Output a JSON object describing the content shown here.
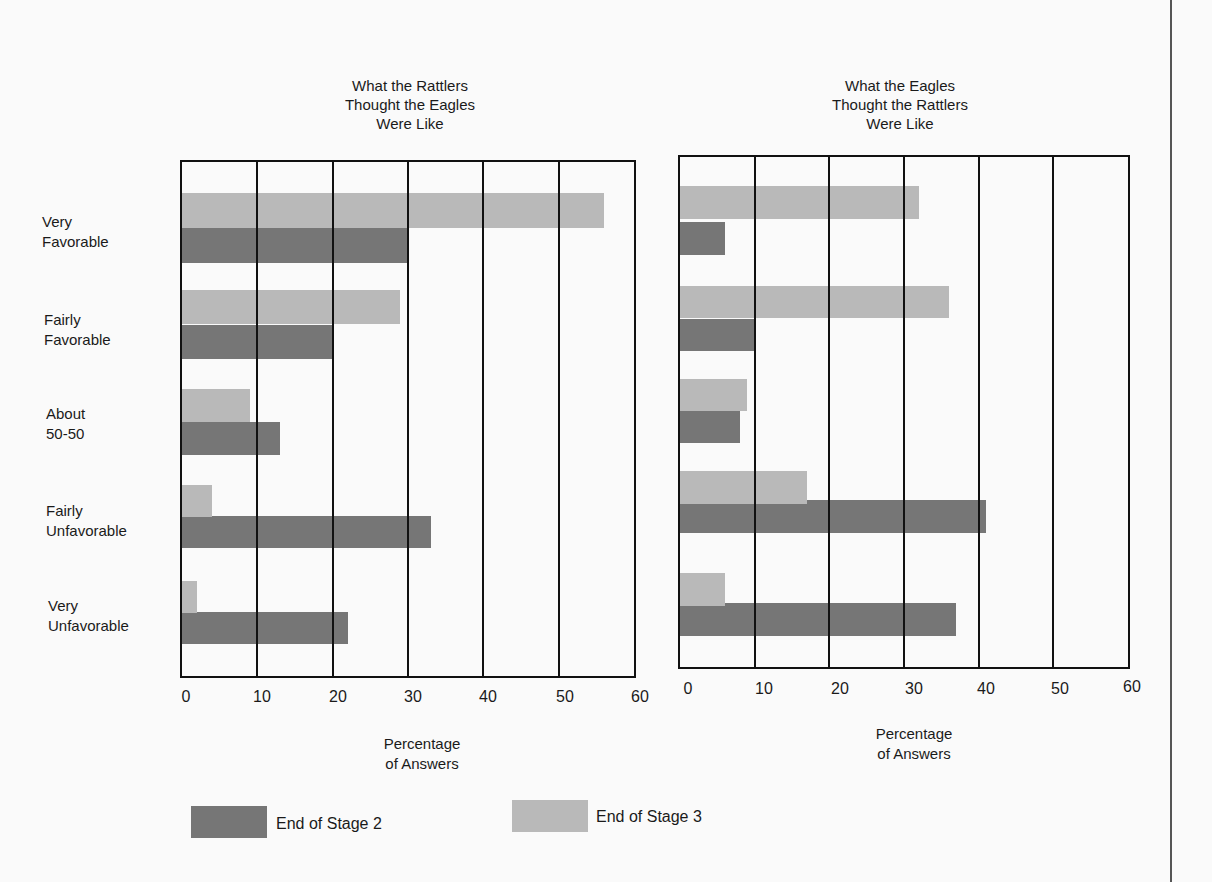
{
  "chart_data": [
    {
      "type": "bar",
      "orientation": "horizontal",
      "title": "What the Rattlers\nThought the Eagles\nWere Like",
      "categories": [
        "Very Favorable",
        "Fairly Favorable",
        "About 50-50",
        "Fairly Unfavorable",
        "Very Unfavorable"
      ],
      "series": [
        {
          "name": "End of Stage 3",
          "values": [
            56,
            29,
            9,
            4,
            2
          ]
        },
        {
          "name": "End of Stage 2",
          "values": [
            30,
            20,
            13,
            33,
            22
          ]
        }
      ],
      "xlabel": "Percentage\nof Answers",
      "ylabel": "",
      "xlim": [
        0,
        60
      ],
      "xticks": [
        0,
        10,
        20,
        30,
        40,
        50,
        60
      ],
      "grid": true
    },
    {
      "type": "bar",
      "orientation": "horizontal",
      "title": "What the Eagles\nThought the Rattlers\nWere Like",
      "categories": [
        "Very Favorable",
        "Fairly Favorable",
        "About 50-50",
        "Fairly Unfavorable",
        "Very Unfavorable"
      ],
      "series": [
        {
          "name": "End of Stage 3",
          "values": [
            32,
            36,
            9,
            17,
            6
          ]
        },
        {
          "name": "End of Stage 2",
          "values": [
            6,
            10,
            8,
            41,
            37
          ]
        }
      ],
      "xlabel": "Percentage\nof Answers",
      "ylabel": "",
      "xlim": [
        0,
        60
      ],
      "xticks": [
        0,
        10,
        20,
        30,
        40,
        50,
        60
      ],
      "grid": true
    }
  ],
  "categories": [
    {
      "line1": "Very",
      "line2": "Favorable"
    },
    {
      "line1": "Fairly",
      "line2": "Favorable"
    },
    {
      "line1": "About",
      "line2": "50-50"
    },
    {
      "line1": "Fairly",
      "line2": "Unfavorable"
    },
    {
      "line1": "Very",
      "line2": "Unfavorable"
    }
  ],
  "left": {
    "title": "What the Rattlers\nThought the Eagles\nWere Like",
    "axis_label": "Percentage\nof Answers"
  },
  "right": {
    "title": "What the Eagles\nThought the Rattlers\nWere Like",
    "axis_label": "Percentage\nof Answers"
  },
  "ticks": [
    "0",
    "10",
    "20",
    "30",
    "40",
    "50",
    "60"
  ],
  "legend": {
    "stage2": {
      "label": "End of Stage 2",
      "color": "#767676"
    },
    "stage3": {
      "label": "End of Stage 3",
      "color": "#b9b9b9"
    }
  }
}
